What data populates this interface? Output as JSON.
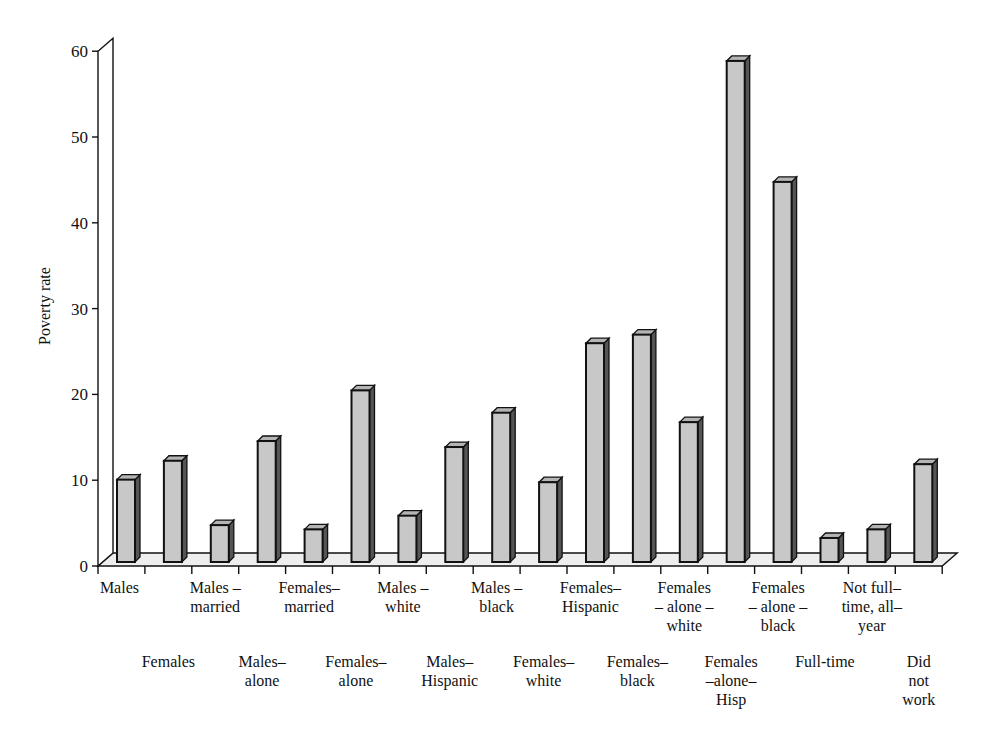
{
  "chart_data": {
    "type": "bar",
    "style": "3d-column",
    "title": "",
    "xlabel": "",
    "ylabel": "Poverty rate",
    "ylim": [
      0,
      60
    ],
    "yticks": [
      0,
      10,
      20,
      30,
      40,
      50,
      60
    ],
    "grid": false,
    "legend": null,
    "categories": [
      "Males",
      "Females",
      "Males – married",
      "Males– alone",
      "Females– married",
      "Females– alone",
      "Males – white",
      "Males– Hispanic",
      "Males – black",
      "Females– white",
      "Females– Hispanic",
      "Females– black",
      "Females – alone – white",
      "Females –alone– Hisp",
      "Females – alone – black",
      "Full-time",
      "Not full– time, all– year",
      "Did not work"
    ],
    "values": [
      9.6,
      11.8,
      4.3,
      14.1,
      3.8,
      20.0,
      5.4,
      13.4,
      17.4,
      9.3,
      25.5,
      26.5,
      16.3,
      58.4,
      44.3,
      2.8,
      3.8,
      11.4
    ],
    "colors": {
      "bar_front": "#c8c8c8",
      "bar_top": "#b4b4b4",
      "bar_side": "#555555",
      "floor": "#eeeeee",
      "outline": "#111111"
    }
  },
  "axis_labels": {
    "display_lines": [
      [
        "Males"
      ],
      [
        "Females"
      ],
      [
        "Males –",
        "married"
      ],
      [
        "Males–",
        "alone"
      ],
      [
        "Females–",
        "married"
      ],
      [
        "Females–",
        "alone"
      ],
      [
        "Males –",
        "white"
      ],
      [
        "Males–",
        "Hispanic"
      ],
      [
        "Males –",
        "black"
      ],
      [
        "Females–",
        "white"
      ],
      [
        "Females–",
        "Hispanic"
      ],
      [
        "Females–",
        "black"
      ],
      [
        "Females",
        "– alone –",
        "white"
      ],
      [
        "Females",
        "–alone–",
        "Hisp"
      ],
      [
        "Females",
        "– alone –",
        "black"
      ],
      [
        "Full-time"
      ],
      [
        "Not full–",
        "time, all–",
        "year"
      ],
      [
        "Did",
        "not",
        "work"
      ]
    ]
  }
}
